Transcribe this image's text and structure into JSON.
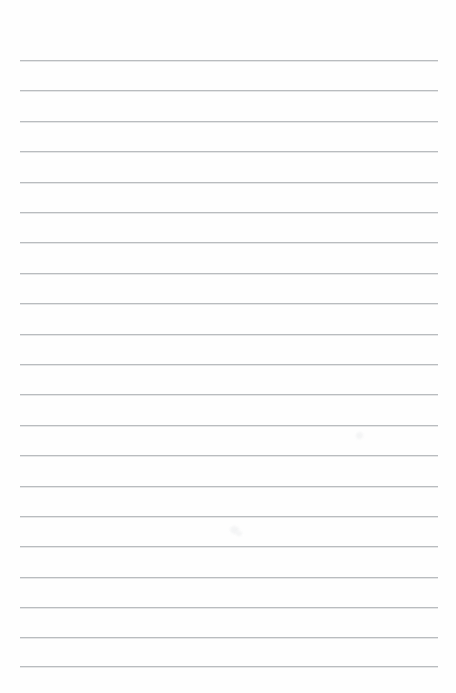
{
  "page": {
    "kind": "scanned-blank-ruled-paper",
    "width": 456,
    "height": 693,
    "background_color": "#ffffff",
    "paper_tint_color": "#fefefe",
    "text_content": "",
    "annotations": "",
    "handwriting": ""
  },
  "ruling": {
    "line_color": "#b9bcbf",
    "line_thickness_px": 1,
    "line_count": 21,
    "line_left_x": 20,
    "line_right_x": 438,
    "line_length_px": 418,
    "first_line_y": 60,
    "last_line_y": 666,
    "line_spacing_px": 30.3,
    "top_margin_px": 60,
    "bottom_margin_px": 27,
    "left_margin_px": 20,
    "right_margin_px": 18,
    "lines": [
      {
        "index": 1,
        "y": 60,
        "x1": 20,
        "x2": 438
      },
      {
        "index": 2,
        "y": 90,
        "x1": 20,
        "x2": 438
      },
      {
        "index": 3,
        "y": 121,
        "x1": 20,
        "x2": 438
      },
      {
        "index": 4,
        "y": 151,
        "x1": 20,
        "x2": 438
      },
      {
        "index": 5,
        "y": 182,
        "x1": 20,
        "x2": 438
      },
      {
        "index": 6,
        "y": 212,
        "x1": 20,
        "x2": 438
      },
      {
        "index": 7,
        "y": 242,
        "x1": 20,
        "x2": 438
      },
      {
        "index": 8,
        "y": 273,
        "x1": 20,
        "x2": 438
      },
      {
        "index": 9,
        "y": 303,
        "x1": 20,
        "x2": 438
      },
      {
        "index": 10,
        "y": 334,
        "x1": 20,
        "x2": 438
      },
      {
        "index": 11,
        "y": 364,
        "x1": 20,
        "x2": 438
      },
      {
        "index": 12,
        "y": 394,
        "x1": 20,
        "x2": 438
      },
      {
        "index": 13,
        "y": 425,
        "x1": 20,
        "x2": 438
      },
      {
        "index": 14,
        "y": 455,
        "x1": 20,
        "x2": 438
      },
      {
        "index": 15,
        "y": 486,
        "x1": 20,
        "x2": 438
      },
      {
        "index": 16,
        "y": 516,
        "x1": 20,
        "x2": 438
      },
      {
        "index": 17,
        "y": 546,
        "x1": 20,
        "x2": 438
      },
      {
        "index": 18,
        "y": 577,
        "x1": 20,
        "x2": 438
      },
      {
        "index": 19,
        "y": 607,
        "x1": 20,
        "x2": 438
      },
      {
        "index": 20,
        "y": 637,
        "x1": 20,
        "x2": 438
      },
      {
        "index": 21,
        "y": 666,
        "x1": 20,
        "x2": 438
      }
    ]
  },
  "blemishes": {
    "color": "#f2f3f4",
    "spots": [
      {
        "x": 356,
        "y": 432,
        "w": 7,
        "h": 7
      },
      {
        "x": 230,
        "y": 526,
        "w": 9,
        "h": 8
      },
      {
        "x": 236,
        "y": 531,
        "w": 6,
        "h": 5
      }
    ]
  }
}
